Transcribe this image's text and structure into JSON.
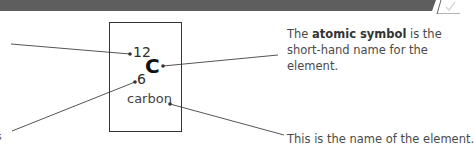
{
  "header": {
    "band_color": "#5e5e5e",
    "icon": "checkmark-icon"
  },
  "element": {
    "mass_number": "12",
    "symbol": "C",
    "atomic_number": "6",
    "name": "carbon"
  },
  "callouts": {
    "symbol": {
      "prefix": "The ",
      "bold": "atomic symbol",
      "suffix": " is the short-hand name for the element."
    },
    "name": {
      "text": "This is the name of the element."
    },
    "cut_off_left": "s"
  },
  "colors": {
    "line": "#555555",
    "box_border": "#333333",
    "text": "#3a3a3a"
  }
}
